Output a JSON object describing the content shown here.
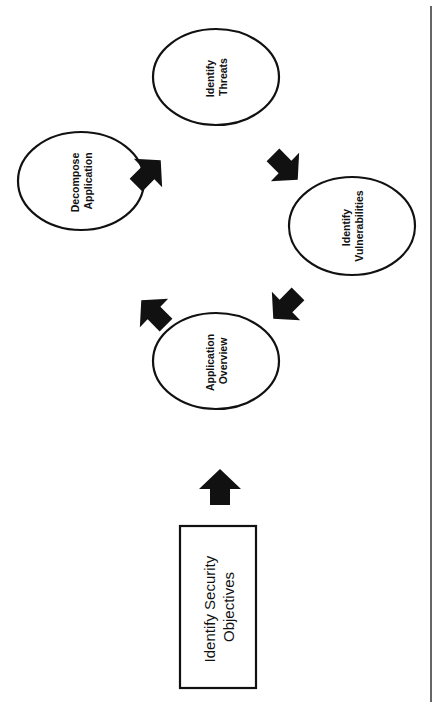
{
  "diagram": {
    "orientation": "rotated-90-ccw",
    "colors": {
      "background": "#ffffff",
      "stroke": "#111111",
      "arrow_fill": "#111111",
      "divider": "#333333"
    },
    "start_box": {
      "line1": "Identify Security",
      "line2": "Objectives"
    },
    "nodes": [
      {
        "id": "application-overview",
        "line1": "Application",
        "line2": "Overview"
      },
      {
        "id": "decompose-application",
        "line1": "Decompose",
        "line2": "Application"
      },
      {
        "id": "identify-threats",
        "line1": "Identify",
        "line2": "Threats"
      },
      {
        "id": "identify-vulnerabilities",
        "line1": "Identify",
        "line2": "Vulnerabilities"
      }
    ],
    "edges": [
      {
        "from": "Identify Security Objectives",
        "to": "Application Overview",
        "direction": "up"
      },
      {
        "from": "Application Overview",
        "to": "Decompose Application",
        "direction": "up-left"
      },
      {
        "from": "Decompose Application",
        "to": "Identify Threats",
        "direction": "up-right"
      },
      {
        "from": "Identify Threats",
        "to": "Identify Vulnerabilities",
        "direction": "down-right"
      },
      {
        "from": "Identify Vulnerabilities",
        "to": "Application Overview",
        "direction": "down-left"
      }
    ]
  }
}
